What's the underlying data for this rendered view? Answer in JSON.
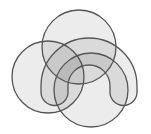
{
  "diagram": {
    "type": "venn",
    "set_count": 4,
    "background": "#ffffff",
    "stroke_color": "#555555",
    "fill_color": "#000000",
    "fill_opacity": 0.075,
    "sets": [
      {
        "id": "left-circle",
        "shape": "circle",
        "cx": 48,
        "cy": 77,
        "r": 36
      },
      {
        "id": "top-circle",
        "shape": "circle",
        "cx": 79,
        "cy": 47,
        "r": 37
      },
      {
        "id": "bottom-circle",
        "shape": "circle",
        "cx": 91,
        "cy": 90,
        "r": 37
      },
      {
        "id": "horseshoe",
        "shape": "arch",
        "cx": 89,
        "cy": 86,
        "outer_r": 48,
        "inner_r": 21,
        "leg_bottom": 92
      }
    ],
    "labels": []
  }
}
